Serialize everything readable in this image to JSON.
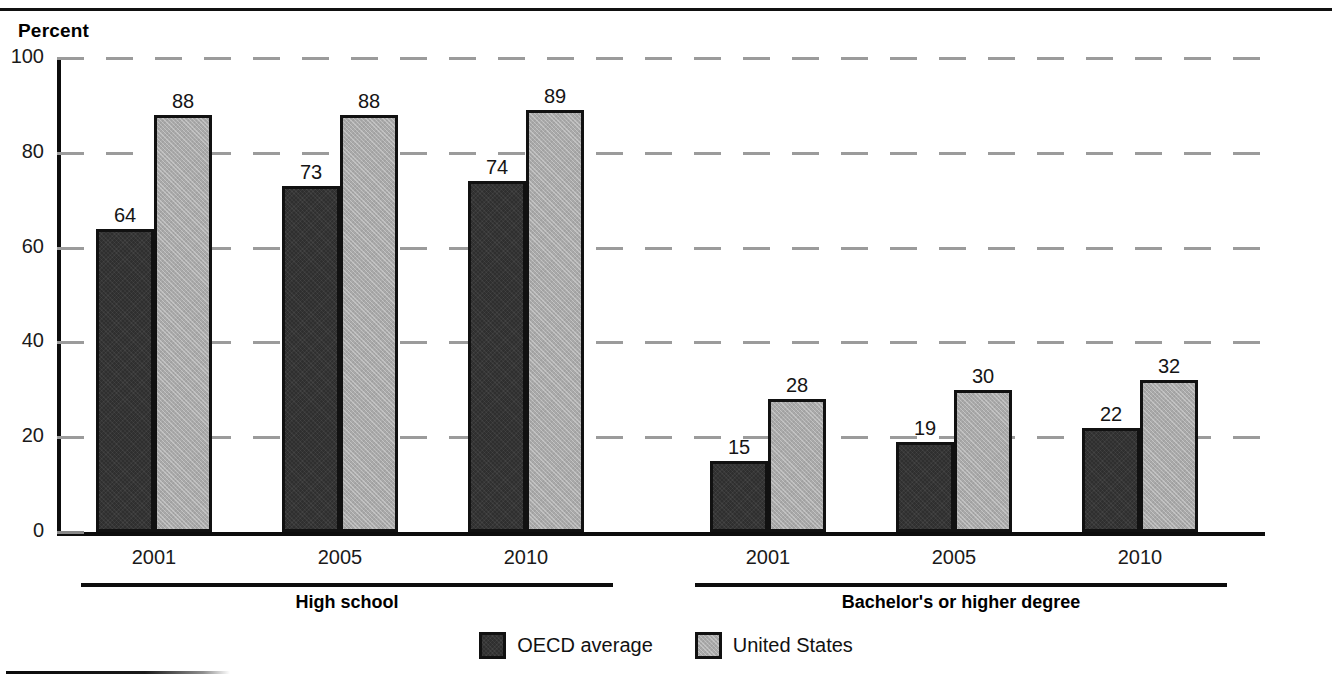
{
  "chart_data": {
    "type": "bar",
    "title": "",
    "ylabel": "Percent",
    "xlabel": "",
    "ylim": [
      0,
      100
    ],
    "ytick_values": [
      0,
      20,
      40,
      60,
      80,
      100
    ],
    "ytick_labels": [
      "0",
      "20",
      "40",
      "60",
      "80",
      "100"
    ],
    "grid": true,
    "grid_axis": "y",
    "grid_style": "dashed",
    "legend_position": "bottom-center",
    "groups": [
      {
        "label": "High school",
        "categories": [
          "2001",
          "2005",
          "2010"
        ]
      },
      {
        "label": "Bachelor's or higher degree",
        "categories": [
          "2001",
          "2005",
          "2010"
        ]
      }
    ],
    "categories": [
      "2001",
      "2005",
      "2010",
      "2001",
      "2005",
      "2010"
    ],
    "series": [
      {
        "name": "OECD average",
        "color": "#2f2f2f",
        "values": [
          64,
          73,
          74,
          15,
          19,
          22
        ]
      },
      {
        "name": "United States",
        "color": "#a9a9a9",
        "values": [
          88,
          88,
          89,
          28,
          30,
          32
        ]
      }
    ]
  },
  "legend": {
    "items": [
      {
        "label": "OECD average",
        "swatch": "dark"
      },
      {
        "label": "United States",
        "swatch": "light"
      }
    ]
  },
  "colors": {
    "series_oecd": "#2f2f2f",
    "series_us": "#a9a9a9",
    "axis": "#0d0d0d",
    "grid": "#9b9b9b",
    "text": "#111111",
    "background": "#ffffff"
  }
}
